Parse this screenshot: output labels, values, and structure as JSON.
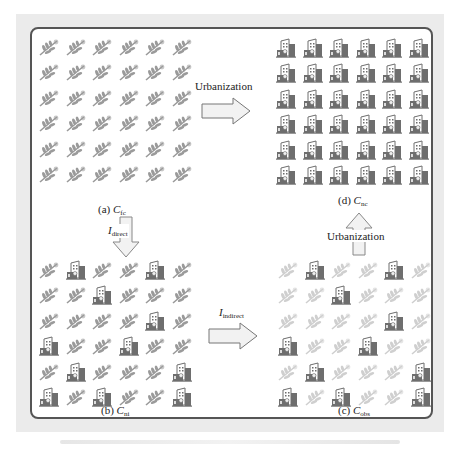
{
  "figure": {
    "panels": [
      {
        "id": "a",
        "label_prefix": "(a) ",
        "symbol": "C",
        "subscript": "fc",
        "description": "all cropland"
      },
      {
        "id": "b",
        "label_prefix": "(b) ",
        "symbol": "C",
        "subscript": "ni",
        "description": "direct urban encroachment"
      },
      {
        "id": "c",
        "label_prefix": "(c) ",
        "symbol": "C",
        "subscript": "obs",
        "description": "observed cropland after indirect effect"
      },
      {
        "id": "d",
        "label_prefix": "(d) ",
        "symbol": "C",
        "subscript": "nc",
        "description": "all urban"
      }
    ],
    "arrows": [
      {
        "id": "a-to-d",
        "label": "Urbanization",
        "direction": "right"
      },
      {
        "id": "a-to-b",
        "symbol": "I",
        "subscript": "direct",
        "direction": "down"
      },
      {
        "id": "b-to-c",
        "symbol": "I",
        "subscript": "indirect",
        "direction": "right"
      },
      {
        "id": "c-to-d",
        "label": "Urbanization",
        "direction": "up"
      }
    ],
    "legend_icons": {
      "crop": "wheat-icon",
      "urban": "building-icon"
    },
    "grids": {
      "a": [
        "cccccc",
        "cccccc",
        "cccccc",
        "cccccc",
        "cccccc",
        "cccccc"
      ],
      "b": [
        "cuccuc",
        "ccuccc",
        "ccccuc",
        "uccucc",
        "cuccu u",
        "uc ucc u"
      ],
      "d": [
        "uuuuuu",
        "uuuuuu",
        "uuuuuu",
        "uuuuuu",
        "uuuuuu",
        "uuuuuu"
      ]
    },
    "grid_layouts": {
      "b": [
        "cuccuc",
        "ccuccc",
        "ccccuc",
        "uccucc",
        "cucccu",
        "uccccu"
      ],
      "b_exact": [
        "c",
        "u",
        "c",
        "c",
        "u",
        "c"
      ],
      "rows_b": [
        "cuccuc",
        "ccuccc",
        "ccccuc",
        "uccucc",
        "cucccu",
        "ucuccu"
      ],
      "rows_c": [
        "cuccuc",
        "ccuccc",
        "ccccuc",
        "uccucc",
        "cucccu",
        "ucuccu"
      ]
    },
    "colors": {
      "crop": "#9a9a9a",
      "crop_faded": "#cfcfcf",
      "urban": "#6e6e6e",
      "frame": "#555555",
      "arrow_fill": "#f2f2f2"
    }
  }
}
